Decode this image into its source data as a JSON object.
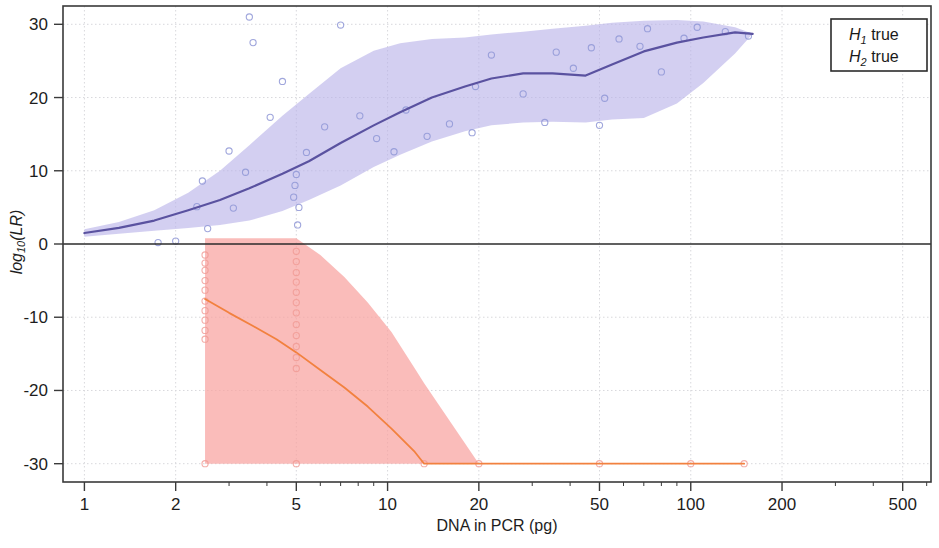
{
  "chart_data": {
    "type": "line",
    "title": "",
    "xlabel": "DNA in PCR (pg)",
    "ylabel": "log10(LR)",
    "xscale": "log",
    "xlim": [
      0.85,
      620
    ],
    "ylim": [
      -32.5,
      32.5
    ],
    "xticks": [
      1,
      2,
      5,
      10,
      20,
      50,
      100,
      200,
      500
    ],
    "xtick_labels": [
      "1",
      "2",
      "5",
      "10",
      "20",
      "50",
      "100",
      "200",
      "500"
    ],
    "yticks": [
      30,
      20,
      10,
      0,
      -10,
      -20,
      -30
    ],
    "ytick_labels": [
      "30",
      "20",
      "10",
      "0",
      "-10",
      "-20",
      "-30"
    ],
    "grid": true,
    "legend_position": "top-right",
    "legend": [
      {
        "label_main": "H",
        "label_sub": "1",
        "label_tail": " true",
        "color": "#6b63b5"
      },
      {
        "label_main": "H",
        "label_sub": "2",
        "label_tail": " true",
        "color": "#f07a4e"
      }
    ],
    "series": [
      {
        "name": "H1 true",
        "kind": "line-with-band",
        "line_color": "#5a52a0",
        "band_color": "#b8b2e8",
        "band_opacity": 0.62,
        "x": [
          1.0,
          1.3,
          1.7,
          2.2,
          2.8,
          3.5,
          4.5,
          5.5,
          7,
          9,
          11,
          14,
          18,
          22,
          28,
          35,
          45,
          55,
          70,
          90,
          110,
          140,
          160
        ],
        "y": [
          1.5,
          2.2,
          3.2,
          4.6,
          6.0,
          7.6,
          9.6,
          11.3,
          13.8,
          16.2,
          18.0,
          20.0,
          21.5,
          22.6,
          23.3,
          23.3,
          23.0,
          24.5,
          26.3,
          27.5,
          28.2,
          28.9,
          28.7
        ],
        "band_upper": [
          2.0,
          3.0,
          4.6,
          7.0,
          10.0,
          13.5,
          17.5,
          20.5,
          24.0,
          26.4,
          27.4,
          28.0,
          28.2,
          28.6,
          29.0,
          29.4,
          29.8,
          30.2,
          30.5,
          30.6,
          30.4,
          29.6,
          28.7
        ],
        "band_lower": [
          1.0,
          1.4,
          1.8,
          2.2,
          2.6,
          3.2,
          4.5,
          6.0,
          8.0,
          10.5,
          12.2,
          14.0,
          15.4,
          16.2,
          16.6,
          16.7,
          16.6,
          17.0,
          17.2,
          19.2,
          22.0,
          26.0,
          28.7
        ]
      },
      {
        "name": "H2 true",
        "kind": "line-with-band",
        "line_color": "#f2813f",
        "band_color": "#f8a2a0",
        "band_opacity": 0.72,
        "x": [
          2.5,
          3.0,
          3.6,
          4.3,
          5.0,
          6.0,
          7.2,
          8.6,
          10.3,
          12.3,
          13.2,
          20,
          50,
          100,
          150
        ],
        "y": [
          -7.5,
          -9.4,
          -11.2,
          -13.0,
          -14.8,
          -17.2,
          -19.6,
          -22.2,
          -25.2,
          -28.4,
          -30.0,
          -30.0,
          -30.0,
          -30.0,
          -30.0
        ],
        "band_upper": [
          0.8,
          0.8,
          0.8,
          0.8,
          0.8,
          -1.5,
          -4.5,
          -8.0,
          -12.0,
          -17.0,
          -19.0,
          -30.0,
          -30.0,
          -30.0,
          -30.0
        ],
        "band_lower": [
          -30.0,
          -30.0,
          -30.0,
          -30.0,
          -30.0,
          -30.0,
          -30.0,
          -30.0,
          -30.0,
          -30.0,
          -30.0,
          -30.0,
          -30.0,
          -30.0,
          -30.0
        ]
      }
    ],
    "scatter": [
      {
        "name": "H1 true points",
        "marker": "circle-open",
        "color": "#8f97d6",
        "points": [
          [
            1.75,
            0.2
          ],
          [
            2.0,
            0.4
          ],
          [
            2.35,
            5.1
          ],
          [
            2.45,
            8.6
          ],
          [
            2.55,
            2.1
          ],
          [
            3.0,
            12.7
          ],
          [
            3.1,
            4.9
          ],
          [
            3.4,
            9.8
          ],
          [
            3.5,
            31.0
          ],
          [
            3.6,
            27.5
          ],
          [
            4.1,
            17.3
          ],
          [
            4.5,
            22.2
          ],
          [
            4.9,
            6.4
          ],
          [
            4.95,
            8.0
          ],
          [
            5.0,
            9.5
          ],
          [
            5.05,
            2.6
          ],
          [
            5.1,
            5.0
          ],
          [
            5.4,
            12.5
          ],
          [
            6.2,
            16.0
          ],
          [
            7.0,
            29.9
          ],
          [
            8.1,
            17.5
          ],
          [
            9.2,
            14.4
          ],
          [
            10.5,
            12.6
          ],
          [
            11.5,
            18.3
          ],
          [
            13.5,
            14.7
          ],
          [
            16.0,
            16.4
          ],
          [
            19.0,
            15.2
          ],
          [
            19.5,
            21.5
          ],
          [
            22.0,
            25.8
          ],
          [
            28.0,
            20.5
          ],
          [
            33.0,
            16.6
          ],
          [
            36.0,
            26.2
          ],
          [
            41.0,
            24.0
          ],
          [
            47.0,
            26.8
          ],
          [
            50.0,
            16.2
          ],
          [
            52.0,
            19.9
          ],
          [
            58.0,
            28.0
          ],
          [
            68.0,
            27.0
          ],
          [
            72.0,
            29.4
          ],
          [
            80.0,
            23.5
          ],
          [
            95.0,
            28.1
          ],
          [
            105.0,
            29.6
          ],
          [
            130.0,
            29.0
          ],
          [
            155.0,
            28.4
          ]
        ]
      },
      {
        "name": "H2 true points",
        "marker": "circle-open",
        "color": "#f09a93",
        "points": [
          [
            2.5,
            -1.5
          ],
          [
            2.5,
            -2.6
          ],
          [
            2.5,
            -3.6
          ],
          [
            2.5,
            -5.0
          ],
          [
            2.5,
            -6.3
          ],
          [
            2.5,
            -7.8
          ],
          [
            2.5,
            -9.1
          ],
          [
            2.5,
            -10.4
          ],
          [
            2.5,
            -11.8
          ],
          [
            2.5,
            -13.0
          ],
          [
            2.5,
            -30.0
          ],
          [
            5.0,
            -1.0
          ],
          [
            5.0,
            -2.4
          ],
          [
            5.0,
            -3.9
          ],
          [
            5.0,
            -5.2
          ],
          [
            5.0,
            -6.6
          ],
          [
            5.0,
            -8.0
          ],
          [
            5.0,
            -9.4
          ],
          [
            5.0,
            -11.0
          ],
          [
            5.0,
            -12.5
          ],
          [
            5.0,
            -14.0
          ],
          [
            5.0,
            -15.5
          ],
          [
            5.0,
            -17.0
          ],
          [
            5.0,
            -30.0
          ],
          [
            13.2,
            -30.0
          ],
          [
            20.0,
            -30.0
          ],
          [
            50.0,
            -30.0
          ],
          [
            100.0,
            -30.0
          ],
          [
            150.0,
            -30.0
          ]
        ]
      }
    ]
  },
  "legend_box": {
    "rows": [
      {
        "h": "H",
        "sub": "1",
        "tail": " true"
      },
      {
        "h": "H",
        "sub": "2",
        "tail": " true"
      }
    ]
  },
  "axes": {
    "x_title": "DNA in PCR (pg)",
    "y_title_main": "log",
    "y_title_sub": "10",
    "y_title_tail": "(LR)"
  }
}
